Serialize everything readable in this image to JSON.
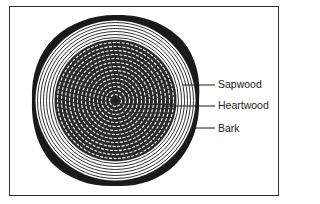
{
  "figure": {
    "labels": [
      {
        "id": "sapwood",
        "text": "Sapwood"
      },
      {
        "id": "heartwood",
        "text": "Heartwood"
      },
      {
        "id": "bark",
        "text": "Bark"
      }
    ]
  },
  "colors": {
    "ink": "#1a1a1a",
    "background": "#ffffff"
  }
}
